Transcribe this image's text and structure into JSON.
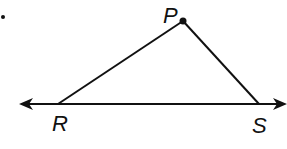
{
  "diagram": {
    "type": "geometry-triangle",
    "bullet": "•",
    "points": {
      "P": {
        "label": "P",
        "x": 183,
        "y": 21
      },
      "R": {
        "label": "R",
        "x": 58,
        "y": 104
      },
      "S": {
        "label": "S",
        "x": 259,
        "y": 104
      }
    },
    "line": {
      "through": [
        "R",
        "S"
      ],
      "arrow_left_x": 20,
      "arrow_right_x": 286,
      "y": 104,
      "description": "line RS with arrows at both ends"
    },
    "segments": [
      {
        "from": "R",
        "to": "P"
      },
      {
        "from": "P",
        "to": "S"
      }
    ],
    "colors": {
      "stroke": "#111111",
      "background": "#ffffff"
    }
  }
}
